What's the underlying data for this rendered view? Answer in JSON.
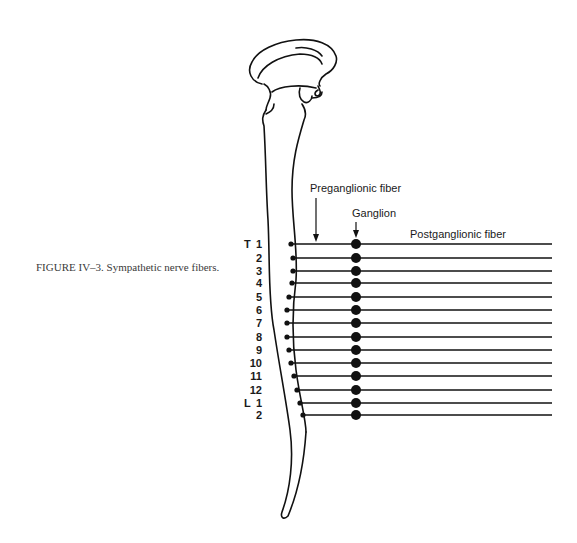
{
  "figure": {
    "caption": "FIGURE IV–3. Sympathetic nerve fibers.",
    "labels": {
      "preganglionic": "Preganglionic fiber",
      "ganglion": "Ganglion",
      "postganglionic": "Postganglionic fiber"
    },
    "segments": [
      {
        "prefix": "T",
        "num": "1",
        "y": 244,
        "start_x": 291
      },
      {
        "prefix": "",
        "num": "2",
        "y": 258,
        "start_x": 293
      },
      {
        "prefix": "",
        "num": "3",
        "y": 271,
        "start_x": 293
      },
      {
        "prefix": "",
        "num": "4",
        "y": 283,
        "start_x": 292
      },
      {
        "prefix": "",
        "num": "5",
        "y": 297,
        "start_x": 289
      },
      {
        "prefix": "",
        "num": "6",
        "y": 310,
        "start_x": 287
      },
      {
        "prefix": "",
        "num": "7",
        "y": 323,
        "start_x": 287
      },
      {
        "prefix": "",
        "num": "8",
        "y": 337,
        "start_x": 287
      },
      {
        "prefix": "",
        "num": "9",
        "y": 350,
        "start_x": 289
      },
      {
        "prefix": "",
        "num": "10",
        "y": 363,
        "start_x": 291
      },
      {
        "prefix": "",
        "num": "11",
        "y": 376,
        "start_x": 294
      },
      {
        "prefix": "",
        "num": "12",
        "y": 390,
        "start_x": 297
      },
      {
        "prefix": "L",
        "num": "1",
        "y": 403,
        "start_x": 300
      },
      {
        "prefix": "",
        "num": "2",
        "y": 415,
        "start_x": 303
      }
    ],
    "ganglion_x": 356,
    "line_end_x": 552,
    "colors": {
      "ink": "#111111",
      "caption": "#3a3a3a"
    }
  }
}
